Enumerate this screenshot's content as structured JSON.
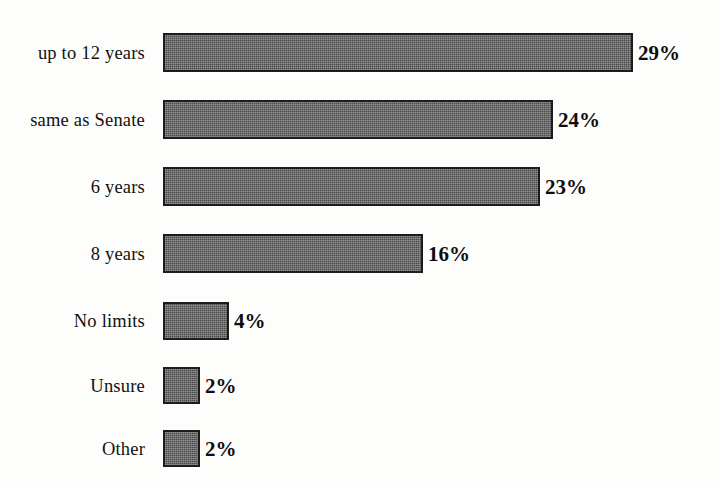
{
  "chart_data": {
    "type": "bar",
    "orientation": "horizontal",
    "title": "",
    "subtitle": "",
    "xlabel": "",
    "ylabel": "",
    "grid": false,
    "legend": null,
    "axis_visible": false,
    "value_suffix": "%",
    "xlim": [
      0,
      29
    ],
    "categories": [
      "up to 12 years",
      "same as Senate",
      "6 years",
      "8 years",
      "No  limits",
      "Unsure",
      "Other"
    ],
    "values": [
      29,
      24,
      23,
      16,
      4,
      2,
      2
    ],
    "value_labels": [
      "29%",
      "24%",
      "23%",
      "16%",
      "4%",
      "2%",
      "2%"
    ],
    "colors": {
      "background": "#fdfdfc",
      "bar_fill": "#636363",
      "bar_border": "#1c1c1c",
      "label_text": "#111111",
      "value_text": "#0d0d0d"
    }
  },
  "rows": [
    {
      "label": "up to 12 years",
      "value_label": "29%",
      "bar_px": 470,
      "top": 33,
      "height": 39
    },
    {
      "label": "same as Senate",
      "value_label": "24%",
      "bar_px": 390,
      "top": 100,
      "height": 39
    },
    {
      "label": "6 years",
      "value_label": "23%",
      "bar_px": 377,
      "top": 167,
      "height": 39
    },
    {
      "label": "8 years",
      "value_label": "16%",
      "bar_px": 260,
      "top": 234,
      "height": 39
    },
    {
      "label": "No  limits",
      "value_label": "4%",
      "bar_px": 66,
      "top": 302,
      "height": 38
    },
    {
      "label": "Unsure",
      "value_label": "2%",
      "bar_px": 37,
      "top": 367,
      "height": 37
    },
    {
      "label": "Other",
      "value_label": "2%",
      "bar_px": 37,
      "top": 430,
      "height": 37
    }
  ]
}
